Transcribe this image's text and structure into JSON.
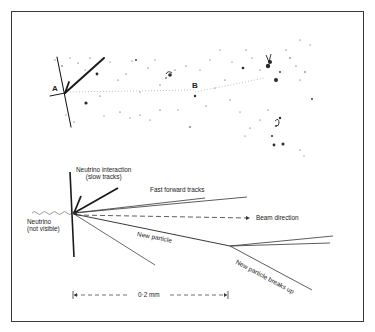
{
  "figure": {
    "type": "neutrino interaction track diagram",
    "photo": {
      "labels": [
        {
          "id": "A",
          "text": "A"
        },
        {
          "id": "B",
          "text": "B"
        }
      ]
    },
    "schematic": {
      "labels": {
        "interaction_line1": "Neutrino interaction",
        "interaction_line2": "(slow tracks)",
        "fast_tracks": "Fast forward tracks",
        "neutrino_line1": "Neutrino",
        "neutrino_line2": "(not visible)",
        "beam": "Beam direction",
        "new_particle": "New particle",
        "breaks_up": "New particle breaks up",
        "scale": "0·2 mm"
      },
      "colors": {
        "ink": "#1a1a1a",
        "frame": "#3a3a3a",
        "background": "#ffffff"
      }
    }
  }
}
